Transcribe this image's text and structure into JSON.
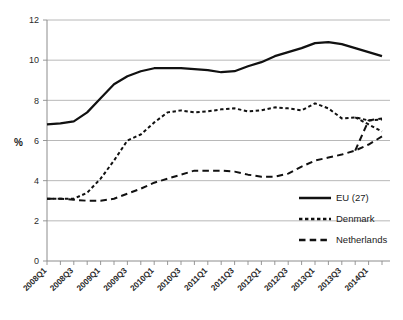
{
  "chart_data": {
    "type": "line",
    "title": "",
    "xlabel": "",
    "ylabel": "%",
    "ylim": [
      0,
      12
    ],
    "ytick_values": [
      0,
      2,
      4,
      6,
      8,
      10,
      12
    ],
    "ytick_labels": [
      "0",
      "2",
      "4",
      "6",
      "8",
      "10",
      "12"
    ],
    "grid": true,
    "legend_position": "inside-bottom-right",
    "x": [
      "2008Q1",
      "2008Q2",
      "2008Q3",
      "2008Q4",
      "2009Q1",
      "2009Q2",
      "2009Q3",
      "2009Q4",
      "2010Q1",
      "2010Q2",
      "2010Q3",
      "2010Q4",
      "2011Q1",
      "2011Q2",
      "2011Q3",
      "2011Q4",
      "2012Q1",
      "2012Q2",
      "2012Q3",
      "2012Q4",
      "2013Q1",
      "2013Q2",
      "2013Q3",
      "2013Q4",
      "2014Q1",
      "2014Q2"
    ],
    "xtick_labels": [
      "2008Q1",
      "2008Q3",
      "2009Q1",
      "2009Q3",
      "2010Q1",
      "2010Q3",
      "2011Q1",
      "2011Q3",
      "2012Q1",
      "2012Q3",
      "2013Q1",
      "2013Q3",
      "2014Q1"
    ],
    "series": [
      {
        "name": "EU (27)",
        "style": "solid",
        "color": "#111111",
        "values": [
          6.8,
          6.85,
          6.95,
          7.4,
          8.1,
          8.8,
          9.2,
          9.45,
          9.6,
          9.6,
          9.6,
          9.55,
          9.5,
          9.4,
          9.45,
          9.7,
          9.9,
          10.2,
          10.4,
          10.6,
          10.85,
          10.9,
          10.8,
          10.6,
          10.4,
          10.2
        ]
      },
      {
        "name": "Denmark",
        "style": "dashed-short",
        "color": "#111111",
        "values": [
          3.1,
          3.1,
          3.1,
          3.4,
          4.1,
          5.0,
          6.0,
          6.3,
          6.9,
          7.4,
          7.5,
          7.4,
          7.45,
          7.55,
          7.6,
          7.45,
          7.5,
          7.65,
          7.6,
          7.5,
          7.85,
          7.6,
          7.1,
          7.15,
          7.0,
          7.05
        ]
      },
      {
        "name": "Netherlands",
        "style": "dashed-long",
        "color": "#111111",
        "values": [
          3.1,
          3.1,
          3.05,
          3.0,
          3.0,
          3.1,
          3.35,
          3.6,
          3.9,
          4.1,
          4.3,
          4.5,
          4.5,
          4.5,
          4.45,
          4.3,
          4.2,
          4.2,
          4.35,
          4.7,
          5.0,
          5.15,
          5.3,
          5.5,
          5.8,
          6.2
        ]
      }
    ],
    "series_extra": [
      {
        "name": "Denmark",
        "tail_x": [
          "2014Q1",
          "2014Q2"
        ],
        "tail_values": [
          6.8,
          6.45
        ]
      },
      {
        "name": "Netherlands",
        "tail_x": [
          "2014Q1",
          "2014Q2"
        ],
        "tail_values": [
          7.0,
          7.1
        ]
      }
    ]
  },
  "axis": {
    "y_title": "%"
  },
  "legend": {
    "items": [
      {
        "label": "EU (27)",
        "style": "solid"
      },
      {
        "label": "Denmark",
        "style": "dashed-short"
      },
      {
        "label": "Netherlands",
        "style": "dashed-long"
      }
    ]
  }
}
